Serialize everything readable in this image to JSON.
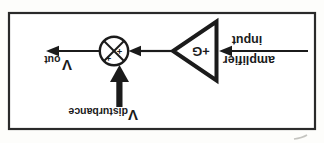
{
  "figure": {
    "amplifier_input_label": {
      "line1": "amplifier",
      "line2": "input"
    },
    "gain_label": "+G",
    "summing_junction": {
      "plus_left": "+",
      "plus_top": "+"
    },
    "v_out": {
      "base": "V",
      "subscript": "out"
    },
    "v_disturbance": {
      "base": "V",
      "subscript": "disturbance"
    },
    "colors": {
      "ink": "#1b1b1b",
      "frame": "#2a2a2a",
      "paper": "#fdfdfb"
    }
  }
}
